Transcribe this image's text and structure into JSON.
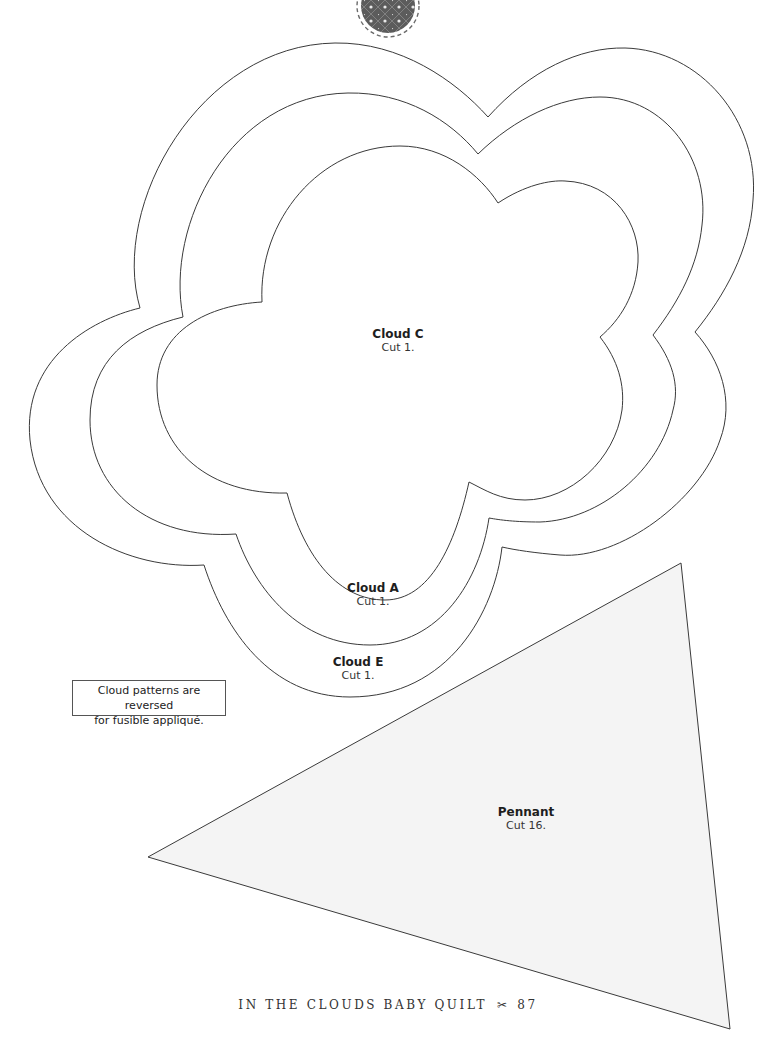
{
  "page": {
    "footer": {
      "title": "IN THE CLOUDS BABY QUILT",
      "separator_icon": "scissors-icon",
      "separator_glyph": "✂",
      "page_number": "87"
    },
    "note": {
      "line1": "Cloud patterns are reversed",
      "line2": "for fusible appliqué."
    },
    "patterns": [
      {
        "name": "Cloud C",
        "instruction": "Cut 1."
      },
      {
        "name": "Cloud A",
        "instruction": "Cut 1."
      },
      {
        "name": "Cloud E",
        "instruction": "Cut 1."
      },
      {
        "name": "Pennant",
        "instruction": "Cut 16."
      }
    ],
    "colors": {
      "outline": "#3a3a3a",
      "pennant_fill": "#f4f4f4",
      "fabric_swatch": "#5a5a5a"
    }
  }
}
